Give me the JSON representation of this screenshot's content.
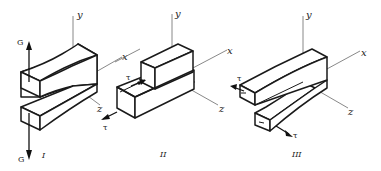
{
  "figure": {
    "colors": {
      "line": "#1a1a1a",
      "axis": "#6a6a6a",
      "background": "#ffffff"
    },
    "panels": [
      {
        "id": "I",
        "caption": "I",
        "axes": {
          "y": "y",
          "x": "x",
          "z": "z"
        },
        "load_symbol_top": "G",
        "load_symbol_bottom": "G",
        "mode": "opening"
      },
      {
        "id": "II",
        "caption": "II",
        "axes": {
          "y": "y",
          "x": "x",
          "z": "z"
        },
        "load_symbol_top": "τ",
        "load_symbol_bottom": "τ",
        "mode": "sliding"
      },
      {
        "id": "III",
        "caption": "III",
        "axes": {
          "y": "y",
          "x": "x",
          "z": "z"
        },
        "load_symbol_top": "τ",
        "load_symbol_bottom": "τ",
        "mode": "tearing"
      }
    ]
  }
}
